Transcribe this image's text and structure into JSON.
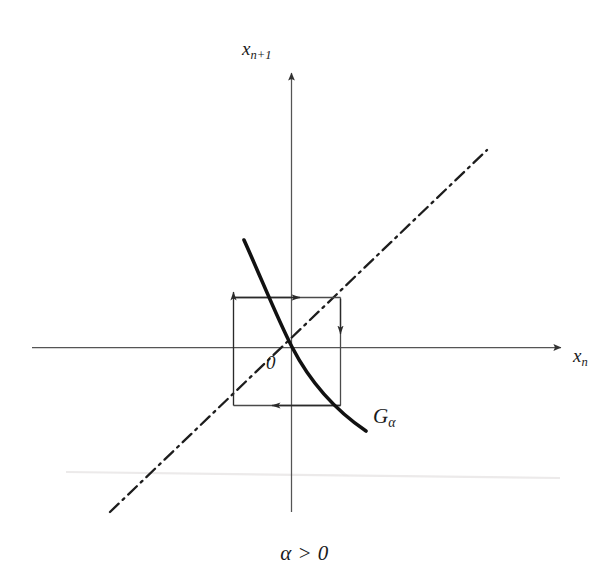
{
  "figure": {
    "kind": "cobweb-diagram",
    "caption": "α > 0",
    "background_color": "#ffffff",
    "ink_color": "#1a1a1a",
    "axis_color": "#555555",
    "labels": {
      "y_axis": "x",
      "y_axis_sub": "n+1",
      "x_axis": "x",
      "x_axis_sub": "n",
      "origin": "0",
      "curve": "G",
      "curve_sub": "α"
    },
    "axes": {
      "origin_px": [
        291,
        347
      ],
      "x_axis_from_px": [
        32,
        347
      ],
      "x_axis_to_px": [
        566,
        347
      ],
      "y_axis_from_px": [
        291,
        512
      ],
      "y_axis_to_px": [
        291,
        68
      ],
      "arrowheads": [
        "x-positive",
        "y-positive"
      ]
    },
    "identity_line": {
      "name": "y = x diagonal",
      "style": "dash-dot",
      "from_px": [
        110,
        512
      ],
      "to_px": [
        487,
        150
      ]
    },
    "curve": {
      "name": "G_alpha",
      "description": "decreasing map through the origin, slope steeper than -1",
      "style": "solid-thick",
      "from_px": [
        244,
        240
      ],
      "to_px": [
        366,
        431
      ]
    },
    "cobweb": {
      "description": "staircase iteration spiralling outward from the fixed point at the origin",
      "box_left_px": 233,
      "box_right_px": 340,
      "box_top_px": 297,
      "box_bottom_px": 405,
      "segments": [
        {
          "name": "upper-horizontal-right",
          "from_px": [
            233,
            297
          ],
          "to_px": [
            340,
            297
          ],
          "arrow": "right",
          "arrow_at_px": [
            296,
            297
          ]
        },
        {
          "name": "right-vertical-down",
          "from_px": [
            340,
            297
          ],
          "to_px": [
            340,
            405
          ],
          "arrow": "down",
          "arrow_at_px": [
            340,
            332
          ]
        },
        {
          "name": "lower-horizontal-left",
          "from_px": [
            340,
            405
          ],
          "to_px": [
            233,
            405
          ],
          "arrow": "left",
          "arrow_at_px": [
            276,
            405
          ]
        },
        {
          "name": "left-vertical-up",
          "from_px": [
            233,
            405
          ],
          "to_px": [
            233,
            288
          ],
          "arrow": "up",
          "arrow_at_px": [
            233,
            292
          ]
        }
      ]
    }
  }
}
